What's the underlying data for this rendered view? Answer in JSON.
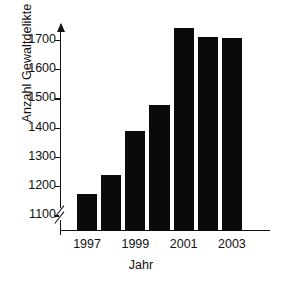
{
  "chart_data": {
    "type": "bar",
    "title": "",
    "subtitle": "",
    "xlabel": "Jahr",
    "ylabel": "Anzahl Gewaltdelikte",
    "categories": [
      "1997",
      "1998",
      "1999",
      "2000",
      "2001",
      "2002",
      "2003"
    ],
    "tick_labels_x": [
      "1997",
      "1999",
      "2001",
      "2003"
    ],
    "values": [
      1175,
      1240,
      1393,
      1480,
      1745,
      1715,
      1710
    ],
    "ylim": [
      1050,
      1775
    ],
    "yticks": [
      1100,
      1200,
      1300,
      1400,
      1500,
      1600,
      1700
    ],
    "ytick_labels": [
      "1100",
      "1200",
      "1300",
      "1400",
      "1500",
      "1600",
      "1700"
    ],
    "axis_break_y": true,
    "grid": false,
    "legend": null,
    "bar_color": "#0a0a0a",
    "axis_color": "#111111",
    "background": "#ffffff",
    "series": [
      {
        "name": "Anzahl Gewaltdelikte",
        "values": [
          1175,
          1240,
          1393,
          1480,
          1745,
          1715,
          1710
        ]
      }
    ]
  },
  "axes": {
    "y_title": "Anzahl Gewaltdelikte",
    "x_title": "Jahr",
    "y_arrow": true,
    "x_arrow": false
  }
}
